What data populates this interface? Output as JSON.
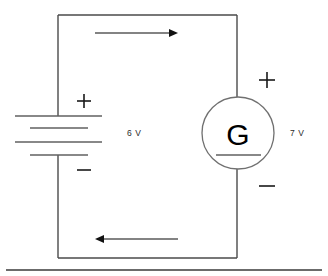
{
  "diagram": {
    "type": "electrical-circuit-schematic",
    "colors": {
      "wire": "#4a4a4a",
      "symbol": "#606060",
      "text": "#2b2b2b",
      "arrow_head": "#111111",
      "background": "#ffffff"
    },
    "loop": {
      "left": 58,
      "top": 15,
      "right": 237,
      "bottom": 258
    },
    "battery": {
      "name": "battery",
      "label": "6 V",
      "label_x": 127,
      "label_y": 136,
      "plus_sign": "+",
      "plus_x": 84,
      "plus_y": 101,
      "minus_sign": "−",
      "minus_x": 84,
      "minus_y": 170,
      "plates": [
        {
          "type": "long",
          "x1": 15,
          "x2": 102,
          "y": 116
        },
        {
          "type": "short",
          "x1": 30,
          "x2": 88,
          "y": 128
        },
        {
          "type": "long",
          "x1": 15,
          "x2": 102,
          "y": 142
        },
        {
          "type": "short",
          "x1": 30,
          "x2": 88,
          "y": 155
        }
      ]
    },
    "generator": {
      "name": "generator",
      "symbol_letter": "G",
      "label": "7 V",
      "label_x": 296,
      "label_y": 136,
      "center_x": 238,
      "center_y": 133,
      "radius": 36,
      "plus_sign": "+",
      "plus_x": 267,
      "plus_y": 80,
      "minus_sign": "−",
      "minus_x": 267,
      "minus_y": 186,
      "inner_bar": {
        "x1": 216,
        "x2": 261,
        "y": 155
      }
    },
    "current_arrows": [
      {
        "name": "top-current-arrow",
        "direction": "right",
        "x1": 95,
        "x2": 178,
        "y": 33
      },
      {
        "name": "bottom-current-arrow",
        "direction": "left",
        "x1": 178,
        "x2": 95,
        "y": 239
      }
    ],
    "baseline": {
      "name": "page-rule",
      "x1": 6,
      "x2": 322,
      "y": 270
    }
  }
}
